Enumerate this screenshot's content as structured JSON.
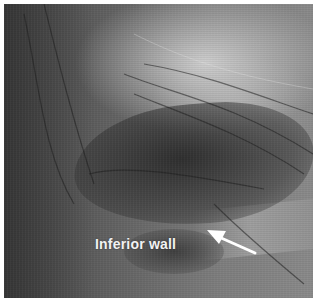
{
  "figure": {
    "annotation": {
      "label": "Inferior wall",
      "arrow": {
        "direction": "up-left",
        "color": "#ffffff"
      }
    },
    "colors": {
      "frame": "#ffffff",
      "text": "#f2f2f2"
    }
  }
}
